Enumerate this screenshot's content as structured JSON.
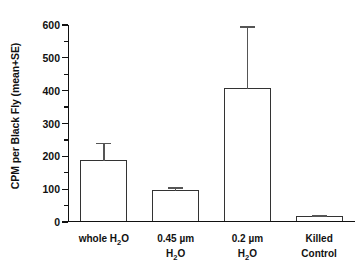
{
  "chart_data": {
    "type": "bar",
    "title": "",
    "xlabel": "",
    "ylabel": "CPM per Black Fly (mean+SE)",
    "categories": [
      "whole H2O",
      "0.45 µm H2O",
      "0.2 µm H2O",
      "Killed Control"
    ],
    "category_labels": [
      {
        "line1": "whole H",
        "sub1": "2",
        "line1b": "O",
        "line2": "",
        "sub2": "",
        "line2b": ""
      },
      {
        "line1": "0.45 µm",
        "sub1": "",
        "line1b": "",
        "line2": "H",
        "sub2": "2",
        "line2b": "O"
      },
      {
        "line1": "0.2 µm",
        "sub1": "",
        "line1b": "",
        "line2": "H",
        "sub2": "2",
        "line2b": "O"
      },
      {
        "line1": "Killed",
        "sub1": "",
        "line1b": "",
        "line2": "Control",
        "sub2": "",
        "line2b": ""
      }
    ],
    "values": [
      187,
      94,
      406,
      15
    ],
    "errors": [
      52,
      10,
      188,
      3
    ],
    "error_type": "SE",
    "ylim": [
      0,
      600
    ],
    "ytick_labels": [
      "0",
      "100",
      "200",
      "300",
      "400",
      "500",
      "600"
    ],
    "ytick_values": [
      0,
      100,
      200,
      300,
      400,
      500,
      600
    ],
    "yminor_values": [
      50,
      150,
      250,
      350,
      450,
      550
    ],
    "grid": false,
    "legend": false,
    "bar_fill_color": "#ffffff",
    "bar_edge_color": "#333333",
    "error_color": "#555555",
    "axis_color": "#111111",
    "background_color": "#ffffff"
  }
}
